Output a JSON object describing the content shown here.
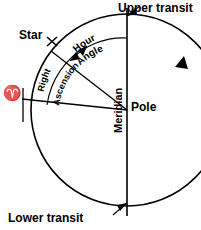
{
  "diagram": {
    "labels": {
      "upper_transit": "Upper transit",
      "lower_transit": "Lower transit",
      "pole": "Pole",
      "star": "Star",
      "meridian": "Meridian",
      "aries": "♈",
      "hour_angle_word1": "Hour",
      "hour_angle_word2": "Angle",
      "right_ascension_word1": "Right",
      "right_ascension_word2": "Ascension"
    },
    "icons": {
      "star_marker": "star-cross-marker",
      "aries_symbol": "aries-vernal-equinox-icon",
      "rotation_arrow": "counterclockwise-rotation-arrow"
    },
    "colors": {
      "stroke": "#000000",
      "background": "#ffffff"
    },
    "geometry": {
      "center_x": 127,
      "center_y": 110,
      "radius": 96,
      "meridian_top_y": 8,
      "meridian_bottom_y": 216,
      "star_angle_deg": 142,
      "aries_angle_deg": 186
    }
  }
}
